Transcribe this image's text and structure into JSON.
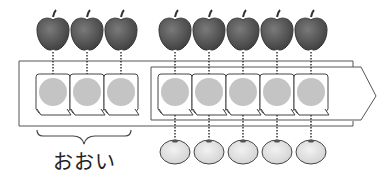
{
  "diagram": {
    "label_more": "おおい",
    "apples": {
      "count": 8,
      "color": "#555555"
    },
    "oranges": {
      "count": 5,
      "color": "#dddddd"
    },
    "counters": {
      "left_extra": 3,
      "matched": 5,
      "fill": "#c4c4c4"
    },
    "colors": {
      "line": "#444444",
      "counter_fill": "#c4c4c4",
      "apple": "#5a5a5a",
      "orange": "#e2e2e2"
    }
  }
}
